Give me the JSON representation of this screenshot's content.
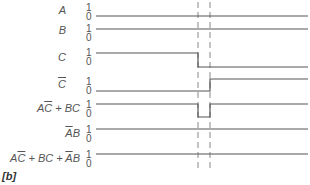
{
  "caption": "[b]",
  "level_high": "1",
  "level_low": "0",
  "colors": {
    "signal": "#555555",
    "dashed": "#888888",
    "text": "#555555"
  },
  "signals": [
    {
      "name": "A",
      "label_html": "A",
      "values": [
        "0"
      ]
    },
    {
      "name": "B",
      "label_html": "B",
      "values": [
        "1"
      ]
    },
    {
      "name": "C",
      "label_html": "C",
      "values": [
        "1",
        "0"
      ]
    },
    {
      "name": "C-bar",
      "label_html": "C̄",
      "values": [
        "0",
        "1"
      ]
    },
    {
      "name": "A-Cbar-plus-BC",
      "label_html": "AC̄ + BC",
      "values": [
        "1",
        "0",
        "1"
      ]
    },
    {
      "name": "Abar-B",
      "label_html": "ĀB",
      "values": [
        "1"
      ]
    },
    {
      "name": "sum",
      "label_html": "AC̄ + BC + ĀB",
      "values": [
        "1"
      ]
    }
  ],
  "labels": {
    "A": "A",
    "B": "B",
    "C": "C",
    "Cbar": "C",
    "expr1_a": "A",
    "expr1_c": "C",
    "expr1_rest": " + BC",
    "expr2_a": "A",
    "expr2_b": "B",
    "expr3_a": "A",
    "expr3_c": "C",
    "expr3_mid": " + BC + ",
    "expr3_a2": "A",
    "expr3_b": "B"
  },
  "transition_markers_x": [
    198,
    210
  ]
}
